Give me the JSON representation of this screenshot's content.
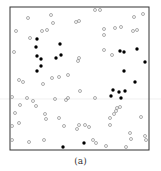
{
  "caption": "(a)",
  "colors": {
    "frame": "#333333",
    "open": "#8a8a8a",
    "filled": "#000000",
    "gridline": "#dddddd"
  },
  "chart_data": {
    "type": "scatter",
    "title": "",
    "xlabel": "",
    "ylabel": "",
    "caption": "(a)",
    "grid": false,
    "legend": null,
    "frame_px": {
      "left": 10,
      "top": 7,
      "right": 149,
      "bottom": 150
    },
    "series": [
      {
        "name": "filled",
        "marker": "filled-circle",
        "points_px": [
          [
            37,
            39
          ],
          [
            36,
            47
          ],
          [
            60,
            44
          ],
          [
            37,
            56
          ],
          [
            41,
            59
          ],
          [
            61,
            55
          ],
          [
            56,
            58
          ],
          [
            41,
            66
          ],
          [
            37,
            71
          ],
          [
            120,
            51
          ],
          [
            124,
            52
          ],
          [
            137,
            49
          ],
          [
            145,
            62
          ],
          [
            124,
            71
          ],
          [
            135,
            82
          ],
          [
            113,
            90
          ],
          [
            119,
            92
          ],
          [
            125,
            91
          ],
          [
            111,
            96
          ],
          [
            121,
            98
          ],
          [
            63,
            147
          ],
          [
            84,
            143
          ]
        ]
      },
      {
        "name": "open",
        "marker": "open-circle",
        "points_px": [
          [
            95,
            10
          ],
          [
            100,
            10
          ],
          [
            51,
            15
          ],
          [
            28,
            18
          ],
          [
            53,
            23
          ],
          [
            76,
            22
          ],
          [
            79,
            21
          ],
          [
            134,
            17
          ],
          [
            143,
            14
          ],
          [
            16,
            31
          ],
          [
            42,
            31
          ],
          [
            47,
            30
          ],
          [
            30,
            38
          ],
          [
            104,
            29
          ],
          [
            104,
            35
          ],
          [
            115,
            28
          ],
          [
            121,
            27
          ],
          [
            133,
            31
          ],
          [
            137,
            30
          ],
          [
            14,
            52
          ],
          [
            104,
            50
          ],
          [
            112,
            55
          ],
          [
            79,
            58
          ],
          [
            78,
            61
          ],
          [
            19,
            80
          ],
          [
            23,
            82
          ],
          [
            43,
            84
          ],
          [
            52,
            78
          ],
          [
            59,
            77
          ],
          [
            68,
            75
          ],
          [
            80,
            91
          ],
          [
            12,
            97
          ],
          [
            27,
            98
          ],
          [
            33,
            101
          ],
          [
            55,
            99
          ],
          [
            66,
            100
          ],
          [
            68,
            98
          ],
          [
            36,
            106
          ],
          [
            20,
            105
          ],
          [
            95,
            98
          ],
          [
            15,
            113
          ],
          [
            45,
            114
          ],
          [
            46,
            119
          ],
          [
            19,
            123
          ],
          [
            59,
            118
          ],
          [
            114,
            114
          ],
          [
            116,
            111
          ],
          [
            117,
            108
          ],
          [
            120,
            107
          ],
          [
            110,
            118
          ],
          [
            141,
            117
          ],
          [
            12,
            126
          ],
          [
            64,
            126
          ],
          [
            77,
            129
          ],
          [
            79,
            125
          ],
          [
            85,
            125
          ],
          [
            89,
            127
          ],
          [
            110,
            125
          ],
          [
            130,
            133
          ],
          [
            12,
            140
          ],
          [
            29,
            142
          ],
          [
            44,
            140
          ],
          [
            93,
            140
          ],
          [
            96,
            143
          ],
          [
            106,
            146
          ],
          [
            126,
            147
          ],
          [
            131,
            139
          ],
          [
            145,
            136
          ],
          [
            146,
            140
          ]
        ]
      }
    ]
  }
}
